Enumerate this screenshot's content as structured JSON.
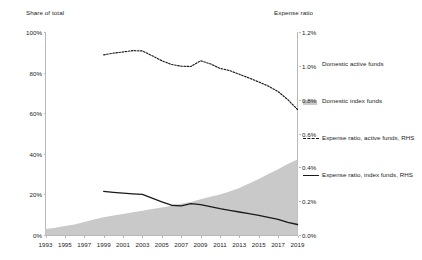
{
  "axes": {
    "left_title": "Share of total",
    "right_title": "Expense ratio",
    "left_ticks": [
      "0%",
      "20%",
      "40%",
      "60%",
      "80%",
      "100%"
    ],
    "right_ticks": [
      "0.0%",
      "0.2%",
      "0.4%",
      "0.6%",
      "0.8%",
      "1.0%",
      "1.2%"
    ],
    "x_ticks": [
      "1993",
      "1995",
      "1997",
      "1999",
      "2001",
      "2003",
      "2005",
      "2007",
      "2009",
      "2011",
      "2013",
      "2015",
      "2017",
      "2019"
    ]
  },
  "legend": {
    "items": [
      {
        "label": "Domestic active funds",
        "marker": "area-swatch-white"
      },
      {
        "label": "Domestic index funds",
        "marker": "area-swatch-gray"
      },
      {
        "label": "Expense ratio, active funds, RHS",
        "marker": "dashed-line"
      },
      {
        "label": "Expense ratio, index funds, RHS",
        "marker": "solid-line"
      }
    ]
  },
  "colors": {
    "index_area": "#c9c9c9",
    "active_area": "#ffffff",
    "line": "#1a1a1a",
    "axis": "#b9b9b9",
    "text": "#222222"
  },
  "chart_data": {
    "type": "area",
    "title": "",
    "xlabel": "",
    "ylabel": "Share of total",
    "y2label": "Expense ratio",
    "xlim": [
      1993,
      2019
    ],
    "ylim": [
      0,
      100
    ],
    "y2lim": [
      0.0,
      1.2
    ],
    "grid": false,
    "legend_position": "right",
    "x": [
      1993,
      1994,
      1995,
      1996,
      1997,
      1998,
      1999,
      2000,
      2001,
      2002,
      2003,
      2004,
      2005,
      2006,
      2007,
      2008,
      2009,
      2010,
      2011,
      2012,
      2013,
      2014,
      2015,
      2016,
      2017,
      2018,
      2019
    ],
    "series": [
      {
        "name": "Domestic index funds",
        "axis": "left",
        "units": "%",
        "type": "area",
        "values": [
          3.0,
          3.6,
          4.4,
          5.2,
          6.4,
          7.6,
          8.8,
          9.6,
          10.4,
          11.2,
          12.0,
          12.8,
          13.6,
          14.4,
          15.4,
          16.2,
          17.6,
          18.8,
          20.0,
          21.4,
          23.2,
          25.4,
          27.6,
          30.0,
          32.4,
          35.0,
          37.2
        ]
      },
      {
        "name": "Domestic active funds",
        "axis": "left",
        "units": "%",
        "type": "area",
        "values": [
          97.0,
          96.4,
          95.6,
          94.8,
          93.6,
          92.4,
          91.2,
          90.4,
          89.6,
          88.8,
          88.0,
          87.2,
          86.4,
          85.6,
          84.6,
          83.8,
          82.4,
          81.2,
          80.0,
          78.6,
          76.8,
          74.6,
          72.4,
          70.0,
          67.6,
          65.0,
          62.8
        ]
      },
      {
        "name": "Expense ratio, active funds, RHS",
        "axis": "right",
        "units": "%",
        "type": "line",
        "style": "dashed",
        "x_start": 1999,
        "values": [
          null,
          null,
          null,
          null,
          null,
          null,
          1.065,
          1.075,
          1.082,
          1.09,
          1.088,
          1.06,
          1.03,
          1.008,
          0.998,
          0.996,
          1.03,
          1.012,
          0.985,
          0.972,
          0.95,
          0.928,
          0.905,
          0.88,
          0.848,
          0.8,
          0.742
        ]
      },
      {
        "name": "Expense ratio, index funds, RHS",
        "axis": "right",
        "units": "%",
        "type": "line",
        "style": "solid",
        "x_start": 1999,
        "values": [
          null,
          null,
          null,
          null,
          null,
          null,
          0.258,
          0.252,
          0.247,
          0.243,
          0.24,
          0.218,
          0.196,
          0.176,
          0.172,
          0.186,
          0.18,
          0.168,
          0.156,
          0.146,
          0.136,
          0.126,
          0.116,
          0.104,
          0.092,
          0.074,
          0.062
        ]
      }
    ]
  }
}
